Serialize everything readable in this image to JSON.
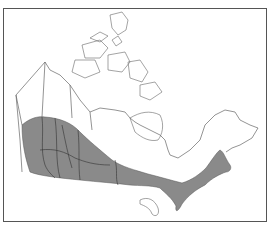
{
  "map": {
    "subject": "Canada",
    "type": "species range map",
    "range_fill_color": "#8a8a8a",
    "outline_color": "#555555",
    "background": "#ffffff",
    "shaded_region": "Southern Canada band from British Columbia coast through the Prairies to southern Ontario, Quebec and the Maritimes"
  }
}
